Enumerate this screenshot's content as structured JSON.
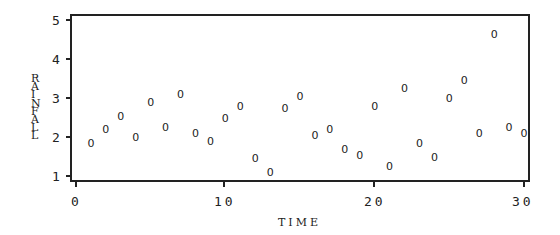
{
  "chart_data": {
    "type": "scatter",
    "title": "",
    "xlabel": "TIME",
    "ylabel": "RAINFALL",
    "xlim": [
      0,
      30
    ],
    "ylim": [
      1,
      5
    ],
    "x_ticks": [
      0,
      10,
      20,
      30
    ],
    "x_tick_labels": [
      "0",
      "10",
      "20",
      "30"
    ],
    "y_ticks": [
      1,
      2,
      3,
      4,
      5
    ],
    "y_tick_labels": [
      "1",
      "2",
      "3",
      "4",
      "5"
    ],
    "grid": false,
    "legend": null,
    "marker_symbol": "0",
    "series": [
      {
        "name": "RAINFALL",
        "x": [
          1,
          2,
          3,
          4,
          5,
          6,
          7,
          8,
          9,
          10,
          11,
          12,
          13,
          14,
          15,
          16,
          17,
          18,
          19,
          20,
          21,
          22,
          23,
          24,
          25,
          26,
          27,
          28,
          29,
          30
        ],
        "y": [
          1.85,
          2.2,
          2.55,
          2.0,
          2.9,
          2.25,
          3.1,
          2.1,
          1.9,
          2.5,
          2.8,
          1.45,
          1.1,
          2.75,
          3.05,
          2.05,
          2.2,
          1.7,
          1.55,
          2.8,
          1.25,
          3.25,
          1.85,
          1.5,
          3.0,
          3.45,
          2.1,
          4.65,
          2.25,
          2.1
        ]
      }
    ]
  },
  "labels": {
    "xlabel": "TIME",
    "ylabel_letters": [
      "R",
      "A",
      "I",
      "N",
      "F",
      "A",
      "L",
      "L"
    ],
    "x_ticks": [
      "0",
      "10",
      "20",
      "30"
    ],
    "y_ticks": [
      "5",
      "4",
      "3",
      "2",
      "1"
    ]
  }
}
